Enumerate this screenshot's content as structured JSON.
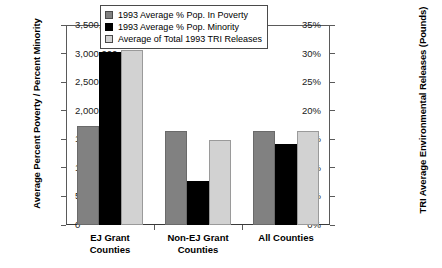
{
  "chart_data": {
    "type": "bar",
    "title": "",
    "xlabel": "",
    "ylabel": "Average Percent Poverty / Percent Minority",
    "ylabel_right": "TRI Average Environmental Releases (Pounds)",
    "categories": [
      "EJ Grant\nCounties",
      "Non-EJ Grant\nCounties",
      "All Counties"
    ],
    "series": [
      {
        "name": "1993 Average % Pop. In Poverty",
        "axis": "left",
        "color": "#818181",
        "values": [
          17.3,
          16.4,
          16.5
        ]
      },
      {
        "name": "1993 Average % Pop. Minority",
        "axis": "left",
        "color": "#000000",
        "values": [
          30.7,
          14.8,
          16.5
        ]
      },
      {
        "name": "Average of Total 1993 TRI Releases",
        "axis": "right",
        "color": "#d2d2d2",
        "values": [
          3020000,
          770000,
          1420000
        ]
      }
    ],
    "draw_order": [
      "1993 Average % Pop. In Poverty",
      "Average of Total 1993 TRI Releases",
      "1993 Average % Pop. Minority"
    ],
    "ylim": [
      0,
      35
    ],
    "ylim_right": [
      0,
      3500000
    ],
    "yticks": [
      "0%",
      "5%",
      "10%",
      "15%",
      "20%",
      "25%",
      "30%",
      "35%"
    ],
    "yticks_right": [
      "0",
      "500,000",
      "1,000,000",
      "1,500,000",
      "2,000,000",
      "2,500,000",
      "3,000,000",
      "3,500,000"
    ],
    "grid": false,
    "legend_position": "top-center"
  }
}
